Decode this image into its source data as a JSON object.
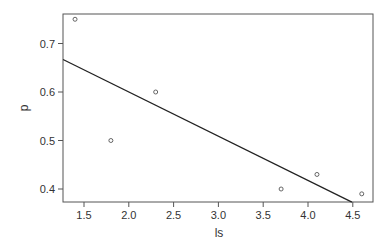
{
  "chart_data": {
    "type": "scatter",
    "title": "",
    "xlabel": "ls",
    "ylabel": "p",
    "xlim": [
      1.266,
      4.72
    ],
    "ylim": [
      0.373,
      0.76
    ],
    "grid": false,
    "legend": null,
    "x_ticks": [
      1.5,
      2.0,
      2.5,
      3.0,
      3.5,
      4.0,
      4.5
    ],
    "x_tick_labels": [
      "1.5",
      "2.0",
      "2.5",
      "3.0",
      "3.5",
      "4.0",
      "4.5"
    ],
    "y_ticks": [
      0.4,
      0.5,
      0.6,
      0.7
    ],
    "y_tick_labels": [
      "0.4",
      "0.5",
      "0.6",
      "0.7"
    ],
    "series": [
      {
        "name": "points",
        "type": "scatter",
        "marker": "open-circle",
        "x": [
          1.4,
          1.8,
          2.3,
          3.7,
          4.1,
          4.6
        ],
        "y": [
          0.75,
          0.5,
          0.6,
          0.4,
          0.43,
          0.39
        ]
      },
      {
        "name": "fit-line",
        "type": "line",
        "x": [
          1.266,
          4.49
        ],
        "y": [
          0.667,
          0.373
        ]
      }
    ]
  },
  "colors": {
    "frame": "#555555",
    "line": "#222222",
    "points": "#555555",
    "text": "#333333"
  }
}
